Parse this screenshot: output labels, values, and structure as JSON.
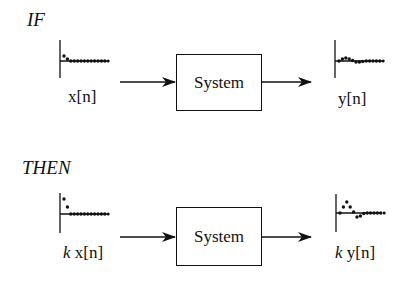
{
  "panels": [
    {
      "condition": "IF",
      "input_label": "x[n]",
      "input_scale": "",
      "system_label": "System",
      "output_label": "y[n]",
      "output_scale": "",
      "input_samples": [
        0.5,
        0.2,
        0,
        0,
        0,
        0,
        0,
        0,
        0,
        0,
        0,
        0,
        0
      ],
      "output_samples": [
        0.0,
        0.2,
        0.3,
        0.2,
        0.05,
        -0.1,
        -0.1,
        -0.05,
        0,
        0,
        0,
        0,
        0
      ]
    },
    {
      "condition": "THEN",
      "input_label": "x[n]",
      "input_scale": "k",
      "system_label": "System",
      "output_label": "y[n]",
      "output_scale": "k",
      "input_samples": [
        1.5,
        0.7,
        0,
        0,
        0,
        0,
        0,
        0,
        0,
        0,
        0,
        0,
        0
      ],
      "output_samples": [
        0.0,
        0.6,
        1.1,
        0.6,
        0.1,
        -0.4,
        -0.3,
        -0.05,
        0,
        0,
        0,
        0,
        0
      ]
    }
  ],
  "colors": {
    "ink": "#111111",
    "background": "#ffffff"
  }
}
